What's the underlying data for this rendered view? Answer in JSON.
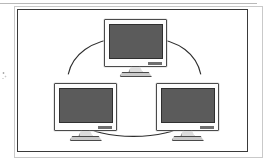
{
  "figure": {
    "kind": "network-topology-diagram",
    "topology": "ring",
    "border_color": "#3a3a3a",
    "background_color": "#ffffff",
    "node_count": 3,
    "link_count": 3
  },
  "nodes": [
    {
      "id": "monitor-top",
      "label": "",
      "position": "top-center",
      "screen_color": "#5b5b5b",
      "bezel_color": "#fdfdfd",
      "outline_color": "#4a4a4a",
      "brand_mark": ""
    },
    {
      "id": "monitor-left",
      "label": "",
      "position": "bottom-left",
      "screen_color": "#5b5b5b",
      "bezel_color": "#fdfdfd",
      "outline_color": "#4a4a4a",
      "brand_mark": ""
    },
    {
      "id": "monitor-right",
      "label": "",
      "position": "bottom-right",
      "screen_color": "#5b5b5b",
      "bezel_color": "#fdfdfd",
      "outline_color": "#4a4a4a",
      "brand_mark": ""
    }
  ],
  "links": [
    {
      "id": "link-top-left",
      "from": "monitor-top",
      "to": "monitor-left",
      "style": "curved",
      "color": "#2e2e2e"
    },
    {
      "id": "link-top-right",
      "from": "monitor-top",
      "to": "monitor-right",
      "style": "curved",
      "color": "#2e2e2e"
    },
    {
      "id": "link-left-right",
      "from": "monitor-left",
      "to": "monitor-right",
      "style": "curved",
      "color": "#2e2e2e"
    }
  ],
  "page": {
    "rule_color": "#b9b9b9",
    "shadow_color": "#c9c9c9"
  }
}
